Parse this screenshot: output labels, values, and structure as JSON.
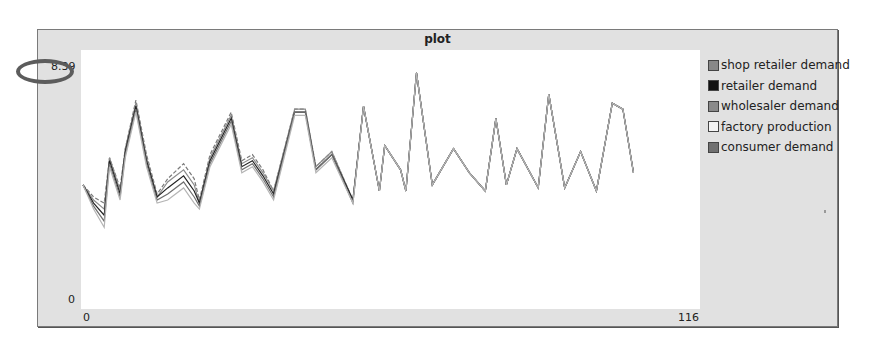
{
  "plot": {
    "title": "plot",
    "y_max_label": "8.39",
    "y_min_label": "0",
    "x_min_label": "0",
    "x_max_label": "116"
  },
  "legend": [
    {
      "label": "shop retailer demand",
      "color": "#888888"
    },
    {
      "label": "retailer demand",
      "color": "#111111"
    },
    {
      "label": "wholesaler demand",
      "color": "#8a8a8a"
    },
    {
      "label": "factory production",
      "color": "#f4f4f4"
    },
    {
      "label": "consumer demand",
      "color": "#707070"
    }
  ],
  "annotation": {
    "target": "y_max_label",
    "shape": "ellipse",
    "color": "#5c5c5c"
  },
  "chart_data": {
    "type": "line",
    "title": "plot",
    "xlabel": "",
    "ylabel": "",
    "xlim": [
      0,
      116
    ],
    "ylim": [
      0,
      8.39
    ],
    "grid": false,
    "legend_position": "right",
    "x": [
      0,
      2,
      4,
      5,
      7,
      8,
      10,
      12,
      14,
      16,
      19,
      21,
      22,
      24,
      28,
      30,
      32,
      34,
      36,
      40,
      42,
      44,
      47,
      51,
      53,
      56,
      57,
      60,
      61,
      63,
      66,
      70,
      73,
      76,
      78,
      80,
      82,
      86,
      88,
      91,
      94,
      97,
      100,
      102,
      104,
      106,
      109,
      112,
      114,
      116
    ],
    "series": [
      {
        "name": "consumer demand",
        "values": [
          4.0,
          3.6,
          3.4,
          4.9,
          3.9,
          5.2,
          6.8,
          5.0,
          3.7,
          4.2,
          4.7,
          4.2,
          3.5,
          5.0,
          6.4,
          4.8,
          5.0,
          4.5,
          3.8,
          6.5,
          6.5,
          4.6,
          5.1,
          3.5,
          6.6,
          3.8,
          5.3,
          4.5,
          3.8,
          7.7,
          4.0,
          5.2,
          4.4,
          3.8,
          6.2,
          4.0,
          5.2,
          3.9,
          7.0,
          3.9,
          5.1,
          3.8,
          6.7,
          6.5,
          4.4,
          5.1,
          3.8,
          6.5,
          4.0,
          4.0
        ]
      },
      {
        "name": "shop retailer demand",
        "values": [
          4.0,
          3.5,
          3.2,
          4.9,
          3.8,
          5.2,
          6.7,
          4.9,
          3.6,
          4.1,
          4.5,
          4.0,
          3.4,
          4.9,
          6.3,
          4.7,
          4.9,
          4.4,
          3.8,
          6.5,
          6.5,
          4.6,
          5.1,
          3.5,
          6.6,
          3.8,
          5.3,
          4.5,
          3.8,
          7.7,
          4.0,
          5.2,
          4.4,
          3.8,
          6.2,
          4.0,
          5.2,
          3.9,
          7.0,
          3.9,
          5.1,
          3.8,
          6.7,
          6.5,
          4.4,
          5.1,
          3.8,
          6.5,
          4.0,
          4.0
        ]
      },
      {
        "name": "retailer demand",
        "values": [
          4.0,
          3.4,
          3.0,
          4.8,
          3.7,
          5.1,
          6.6,
          4.8,
          3.6,
          3.9,
          4.3,
          3.8,
          3.4,
          4.8,
          6.2,
          4.6,
          4.8,
          4.3,
          3.7,
          6.4,
          6.4,
          4.5,
          5.0,
          3.5,
          6.6,
          3.8,
          5.3,
          4.5,
          3.8,
          7.7,
          4.0,
          5.2,
          4.4,
          3.8,
          6.2,
          4.0,
          5.2,
          3.9,
          7.0,
          3.9,
          5.1,
          3.8,
          6.7,
          6.5,
          4.4,
          5.1,
          3.8,
          6.5,
          4.0,
          4.0
        ]
      },
      {
        "name": "wholesaler demand",
        "values": [
          4.0,
          3.3,
          2.8,
          4.7,
          3.6,
          5.0,
          6.5,
          4.7,
          3.5,
          3.7,
          4.1,
          3.6,
          3.3,
          4.7,
          6.1,
          4.5,
          4.7,
          4.2,
          3.6,
          6.4,
          6.4,
          4.5,
          5.0,
          3.4,
          6.6,
          3.8,
          5.3,
          4.5,
          3.8,
          7.7,
          4.0,
          5.2,
          4.4,
          3.8,
          6.2,
          4.0,
          5.2,
          3.9,
          7.0,
          3.9,
          5.1,
          3.8,
          6.7,
          6.5,
          4.4,
          5.1,
          3.8,
          6.5,
          4.0,
          4.0
        ]
      },
      {
        "name": "factory production",
        "values": [
          4.0,
          3.2,
          2.6,
          4.6,
          3.5,
          4.9,
          6.4,
          4.6,
          3.4,
          3.5,
          3.9,
          3.4,
          3.2,
          4.6,
          6.0,
          4.4,
          4.6,
          4.1,
          3.5,
          6.3,
          6.3,
          4.4,
          4.9,
          3.4,
          6.6,
          3.8,
          5.3,
          4.5,
          3.8,
          7.7,
          4.0,
          5.2,
          4.4,
          3.8,
          6.2,
          4.0,
          5.2,
          3.9,
          7.0,
          3.9,
          5.1,
          3.8,
          6.7,
          6.5,
          4.4,
          5.1,
          3.8,
          6.5,
          4.0,
          4.0
        ]
      }
    ]
  }
}
